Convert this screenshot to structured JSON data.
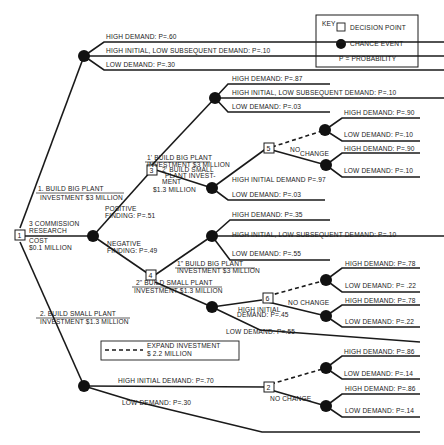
{
  "key": {
    "title": "KEY",
    "decision_point": "DECISION POINT",
    "chance_event": "CHANCE EVENT",
    "probability": "P = PROBABILITY"
  },
  "legend_expand": {
    "line1": "EXPAND INVESTMENT",
    "line2": "$ 2.2  MILLION"
  },
  "nodes": {
    "d1": "1",
    "d2": "2",
    "d3": "3",
    "d4": "4",
    "d5": "5",
    "d6": "6"
  },
  "root": {
    "research_line1": "3 COMMISSION",
    "research_line2": "RESEARCH",
    "cost_line1": "COST",
    "cost_line2": "$0.1 MILLION"
  },
  "branch_big": {
    "line1": "1. BUILD BIG PLANT",
    "line2": "INVESTMENT $3 MILLION",
    "outcomes": [
      "HIGH DEMAND: P=.60",
      "HIGH INITIAL, LOW SUBSEQUENT DEMAND: P=.10",
      "LOW DEMAND: P=.30"
    ]
  },
  "branch_small": {
    "line1": "2. BUILD SMALL PLANT",
    "line2": "INVESTMENT $1.3 MILLION",
    "high_initial": "HIGH INITIAL DEMAND: P=.70",
    "low": "LOW DEMAND: P=.30",
    "no_change": "NO CHANGE",
    "expand_outcomes": [
      "HIGH DEMAND: P=.86",
      "LOW DEMAND: P=.14"
    ],
    "nochange_outcomes": [
      "HIGH DEMAND: P=.86",
      "LOW DEMAND: P=.14"
    ]
  },
  "research": {
    "positive": {
      "line1": "POSITIVE",
      "line2": "FINDING: P=.51"
    },
    "negative": {
      "line1": "NEGATIVE",
      "line2": "FINDING: P=.49"
    }
  },
  "pos_big": {
    "line1": "1' BUILD BIG PLANT",
    "line2": "INVESTMENT $3 MILLION",
    "outcomes": [
      "HIGH DEMAND: P=.87",
      "HIGH INITIAL, LOW SUBSEQUENT DEMAND: P=.10",
      "LOW DEMAND: P=.03"
    ]
  },
  "pos_small": {
    "line1": "2' BUILD SMALL",
    "line2": "PLANT INVEST-",
    "line3": "MENT",
    "line4": "$1.3 MILLION",
    "high_initial": "HIGH INITIAL DEMAND P=.97",
    "low": "LOW DEMAND: P=.03",
    "no_change_a": "NO",
    "no_change_b": "CHANGE",
    "expand_outcomes": [
      "HIGH DEMAND: P=.90",
      "LOW DEMAND: P=.10"
    ],
    "nochange_outcomes": [
      "HIGH DEMAND: P=.90",
      "LOW DEMAND: P=.10"
    ]
  },
  "neg_big": {
    "line1": "1\" BUILD BIG PLANT",
    "line2": "INVESTMENT $3 MILLION",
    "outcomes": [
      "HIGH DEMAND: P=.35",
      "HIGH INITIAL, LOW SUBSEQUENT DEMAND: P=.10",
      "LOW DEMAND: P=.55"
    ]
  },
  "neg_small": {
    "line1": "2\" BUILD SMALL PLANT",
    "line2": "INVESTMENT $1.3 MILLION",
    "high_initial_a": "HIGH INITIAL",
    "high_initial_b": "DEMAND: P=.45",
    "low": "LOW DEMAND: P=.55",
    "no_change": "NO  CHANGE",
    "expand_outcomes": [
      "HIGH DEMAND: P=.78",
      "LOW DEMAND: P= .22"
    ],
    "nochange_outcomes": [
      "HIGH DEMAND: P=.78",
      "LOW DEMAND: P=.22"
    ]
  }
}
